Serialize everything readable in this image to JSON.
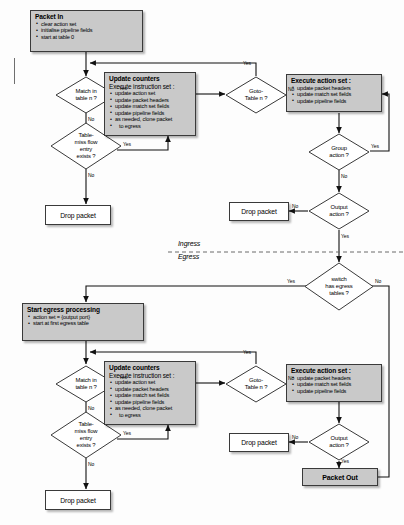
{
  "diagram": {
    "zones": {
      "ingress_label": "Ingress",
      "egress_label": "Egress"
    },
    "colors": {
      "process_fill": "#c9c9c9",
      "decision_fill": "#ffffff",
      "stroke": "#3a3a3a",
      "terminal_fill": "#c9c9c9"
    },
    "ingress": {
      "packet_in": {
        "title": "Packet In",
        "items": [
          "clear action set",
          "initialise pipeline fields",
          "start at table 0"
        ]
      },
      "match_decision": {
        "line1": "Match in",
        "line2": "table n ?"
      },
      "tablemiss_decision": {
        "line1": "Table-",
        "line2": "miss flow",
        "line3": "entry",
        "line4": "exists ?"
      },
      "update_counters": {
        "title": "Update counters",
        "subtitle": "Execute instruction set :",
        "items": [
          "update action set",
          "update packet headers",
          "update match set fields",
          "update pipeline fields",
          "as needed, clone packet",
          "to egress"
        ]
      },
      "goto_decision": {
        "line1": "Goto-",
        "line2": "Table n ?"
      },
      "execute_action_set": {
        "title": "Execute action set :",
        "items": [
          "update packet headers",
          "update match set fields",
          "update pipeline fields"
        ]
      },
      "group_decision": {
        "line1": "Group",
        "line2": "action ?"
      },
      "output_decision": {
        "line1": "Output",
        "line2": "action ?"
      },
      "drop_packet_left": "Drop packet",
      "drop_packet_right": "Drop packet"
    },
    "egress_gate": {
      "line1": "switch",
      "line2": "has egress",
      "line3": "tables ?"
    },
    "egress": {
      "start_egress": {
        "title": "Start egress processing",
        "items": [
          "action set = {output port}",
          "start at first egress table"
        ]
      },
      "match_decision": {
        "line1": "Match in",
        "line2": "table n ?"
      },
      "tablemiss_decision": {
        "line1": "Table-",
        "line2": "miss flow",
        "line3": "entry",
        "line4": "exists ?"
      },
      "update_counters": {
        "title": "Update counters",
        "subtitle": "Execute instruction set :",
        "items": [
          "update action set",
          "update packet headers",
          "update match set fields",
          "update pipeline fields",
          "as needed, clone packet",
          "to egress"
        ]
      },
      "goto_decision": {
        "line1": "Goto-",
        "line2": "Table n ?"
      },
      "execute_action_set": {
        "title": "Execute action set :",
        "items": [
          "update packet headers",
          "update match set fields",
          "update pipeline fields"
        ]
      },
      "output_decision": {
        "line1": "Output",
        "line2": "action ?"
      },
      "drop_packet_left": "Drop packet",
      "drop_packet_right": "Drop packet",
      "packet_out": "Packet Out"
    },
    "edge_labels": {
      "yes": "Yes",
      "no": "No"
    }
  }
}
